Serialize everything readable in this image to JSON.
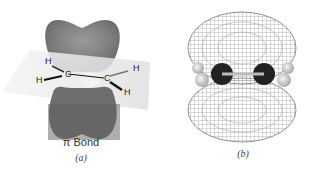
{
  "panel_a": {
    "bond_label": "π Bond",
    "sub_label": "(a)",
    "atoms": [
      {
        "id": "h1",
        "label": "H"
      },
      {
        "id": "h2",
        "label": "H"
      },
      {
        "id": "c1",
        "label": "C"
      },
      {
        "id": "c2",
        "label": "C"
      },
      {
        "id": "h3",
        "label": "H"
      },
      {
        "id": "h4",
        "label": "H"
      }
    ],
    "colors": {
      "lobe": "#7a7a7a",
      "lobe_dark": "#5a5a5a",
      "plane": "#e6e6e6"
    }
  },
  "panel_b": {
    "sub_label": "(b)",
    "colors": {
      "mesh": "#8a8a8a",
      "carbon": "#222222",
      "hydrogen": "#d8d8d8"
    }
  }
}
